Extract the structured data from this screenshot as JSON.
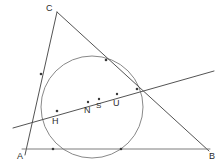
{
  "figure": {
    "canvas": {
      "width": 224,
      "height": 168,
      "background": "#ffffff"
    },
    "style": {
      "line_color": "#6e6e6e",
      "line_color_dark": "#4a4a4a",
      "circle_color": "#7a7a7a",
      "point_color": "#3a3a3a",
      "label_color": "#2b2b2b"
    },
    "vertices": [
      {
        "name": "C",
        "label": "C",
        "x": 57,
        "y": 12,
        "label_x": 46,
        "label_y": 4
      },
      {
        "name": "A",
        "label": "A",
        "x": 25,
        "y": 150,
        "label_x": 17,
        "label_y": 152
      },
      {
        "name": "B",
        "label": "B",
        "x": 208,
        "y": 150,
        "label_x": 209,
        "label_y": 152
      }
    ],
    "segments": [
      {
        "name": "side-CA",
        "from": "C",
        "to": "A",
        "x1": 57,
        "y1": 12,
        "x2": 25,
        "y2": 155
      },
      {
        "name": "side-CB",
        "from": "C",
        "to": "B",
        "x1": 57,
        "y1": 12,
        "x2": 209,
        "y2": 151
      },
      {
        "name": "side-AB",
        "from": "A",
        "to": "B",
        "x1": 22,
        "y1": 149,
        "x2": 210,
        "y2": 149
      },
      {
        "name": "transversal-line",
        "from": "left-end",
        "to": "right-end",
        "x1": 13,
        "y1": 128,
        "x2": 214,
        "y2": 71
      }
    ],
    "circle": {
      "name": "inscribed-circle",
      "cx": 92,
      "cy": 107,
      "r": 51
    },
    "marked_points": [
      {
        "name": "point-H",
        "label": "H",
        "x": 57,
        "y": 115,
        "label_x": 52,
        "label_y": 117
      },
      {
        "name": "point-N",
        "label": "N",
        "x": 88,
        "y": 106,
        "label_x": 84,
        "label_y": 106
      },
      {
        "name": "point-S",
        "label": "S",
        "x": 99,
        "y": 103,
        "label_x": 96,
        "label_y": 102
      },
      {
        "name": "point-U",
        "label": "U",
        "x": 117,
        "y": 98,
        "label_x": 113,
        "label_y": 99
      }
    ],
    "intersection_dots": [
      {
        "name": "dot-ca-tangent",
        "x": 41,
        "y": 74
      },
      {
        "name": "dot-cb-tangent",
        "x": 106,
        "y": 60
      },
      {
        "name": "dot-cb-circle",
        "x": 137,
        "y": 89
      },
      {
        "name": "dot-ab-left",
        "x": 53,
        "y": 149
      },
      {
        "name": "dot-ab-right",
        "x": 121,
        "y": 149
      },
      {
        "name": "dot-transversal-h",
        "x": 57,
        "y": 111
      },
      {
        "name": "dot-transversal-n",
        "x": 88,
        "y": 102
      },
      {
        "name": "dot-transversal-s",
        "x": 99,
        "y": 99
      },
      {
        "name": "dot-transversal-u",
        "x": 117,
        "y": 94
      }
    ]
  }
}
